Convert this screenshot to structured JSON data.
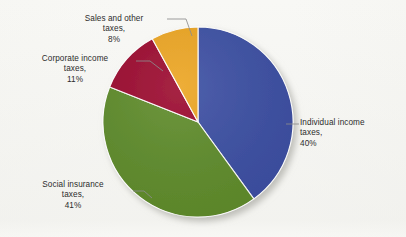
{
  "chart_data": {
    "type": "pie",
    "title": "",
    "categories": [
      "Individual income taxes",
      "Social insurance taxes",
      "Corporate income taxes",
      "Sales and other taxes"
    ],
    "values": [
      40,
      41,
      11,
      8
    ],
    "value_unit": "%",
    "colors": [
      "#3c4fa3",
      "#5f8c2b",
      "#9c0b2f",
      "#eca522"
    ],
    "start_angle_deg": 0,
    "direction": "clockwise",
    "legend": "none",
    "labels_placement": "outside-with-leader-lines",
    "grid": false,
    "slices": [
      {
        "name": "Individual income taxes",
        "value": 40,
        "color": "#3c4fa3",
        "label_lines": [
          "Individual income",
          "taxes,",
          "40%"
        ]
      },
      {
        "name": "Social insurance taxes",
        "value": 41,
        "color": "#5f8c2b",
        "label_lines": [
          "Social insurance",
          "taxes,",
          "41%"
        ]
      },
      {
        "name": "Corporate income taxes",
        "value": 11,
        "color": "#9c0b2f",
        "label_lines": [
          "Corporate income",
          "taxes,",
          "11%"
        ]
      },
      {
        "name": "Sales and other taxes",
        "value": 8,
        "color": "#eca522",
        "label_lines": [
          "Sales and other",
          "taxes,",
          "8%"
        ]
      }
    ]
  },
  "labels": {
    "sales": {
      "l1": "Sales and other",
      "l2": "taxes,",
      "l3": "8%"
    },
    "corporate": {
      "l1": "Corporate income",
      "l2": "taxes,",
      "l3": "11%"
    },
    "social": {
      "l1": "Social insurance",
      "l2": "taxes,",
      "l3": "41%"
    },
    "individual": {
      "l1": "Individual income",
      "l2": "taxes,",
      "l3": "40%"
    }
  },
  "style": {
    "background": "#f8f8f5",
    "text_color": "#2c2c2c",
    "leader_line_color": "#8d8d8d",
    "slice_outline_color": "#ffffff",
    "shadow_color": "#c9c9c4"
  }
}
